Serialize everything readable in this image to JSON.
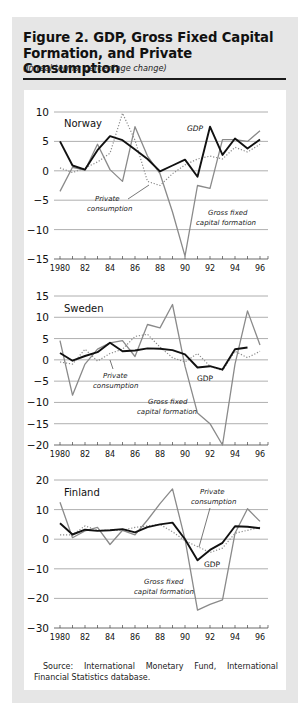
{
  "figure": {
    "title": "Figure 2.  GDP, Gross Fixed Capital Formation, and Private Consumption",
    "title_line1": "Figure 2.  GDP, Gross Fixed Capital",
    "title_line2": "Formation, and Private Consumption",
    "subtitle": "(In real terms; percentage change)",
    "source": "Source: International Monetary Fund, International Financial Statistics database."
  },
  "colors": {
    "frame": "#e6e6e6",
    "gdp": "#111111",
    "gfcf": "#8a8a8a",
    "private_consumption": "#8a8a8a",
    "grid": "#9a9a9a"
  },
  "chart_data": [
    {
      "type": "line",
      "panel": "Norway",
      "title": "Norway",
      "xlabel": "",
      "ylabel": "percentage change",
      "x": [
        1980,
        1981,
        1982,
        1983,
        1984,
        1985,
        1986,
        1987,
        1988,
        1989,
        1990,
        1991,
        1992,
        1993,
        1994,
        1995,
        1996
      ],
      "x_tick_labels": [
        "1980",
        "82",
        "84",
        "86",
        "88",
        "90",
        "92",
        "94",
        "96"
      ],
      "ylim": [
        -15,
        10
      ],
      "y_ticks": [
        10,
        5,
        0,
        -5,
        -10,
        -15
      ],
      "y_tick_labels": [
        "10",
        "5",
        "0",
        "−5",
        "−10",
        "−15"
      ],
      "grid": true,
      "series": [
        {
          "name": "GDP",
          "style": "solid-thick-black",
          "values": [
            5.0,
            0.9,
            0.2,
            3.5,
            5.9,
            5.2,
            3.6,
            2.0,
            -0.1,
            0.9,
            1.9,
            -1.0,
            7.5,
            2.7,
            5.5,
            3.8,
            5.3
          ]
        },
        {
          "name": "Private consumption",
          "style": "dotted-gray",
          "values": [
            0.5,
            -0.3,
            0.5,
            1.5,
            3.0,
            9.8,
            5.2,
            -1.8,
            -2.5,
            -0.5,
            1.0,
            2.0,
            2.5,
            2.0,
            4.0,
            3.2,
            4.5
          ]
        },
        {
          "name": "Gross fixed capital formation",
          "style": "solid-gray",
          "values": [
            -3.5,
            0.6,
            0.1,
            4.5,
            0.2,
            -1.8,
            7.5,
            2.5,
            -0.5,
            -7.0,
            -14.5,
            -2.5,
            -3.0,
            5.3,
            5.3,
            5.0,
            6.8
          ]
        }
      ],
      "annotations": [
        "GDP",
        "Private consumption",
        "Gross fixed capital formation"
      ]
    },
    {
      "type": "line",
      "panel": "Sweden",
      "title": "Sweden",
      "xlabel": "",
      "ylabel": "percentage change",
      "x": [
        1980,
        1981,
        1982,
        1983,
        1984,
        1985,
        1986,
        1987,
        1988,
        1989,
        1990,
        1991,
        1992,
        1993,
        1994,
        1995,
        1996
      ],
      "x_tick_labels": [
        "1980",
        "82",
        "84",
        "86",
        "88",
        "90",
        "92",
        "94",
        "96"
      ],
      "ylim": [
        -20,
        15
      ],
      "y_ticks": [
        15,
        10,
        5,
        0,
        -5,
        -10,
        -15,
        -20
      ],
      "y_tick_labels": [
        "15",
        "10",
        "5",
        "0",
        "−5",
        "−10",
        "−15",
        "−20"
      ],
      "grid": true,
      "series": [
        {
          "name": "GDP",
          "style": "solid-thick-black",
          "values": [
            1.6,
            -0.2,
            0.9,
            1.8,
            4.0,
            2.0,
            2.2,
            2.7,
            2.6,
            2.3,
            1.3,
            -1.8,
            -1.5,
            -2.3,
            2.5,
            2.9,
            null
          ]
        },
        {
          "name": "Private consumption",
          "style": "dotted-gray",
          "values": [
            -0.5,
            -1.0,
            2.5,
            -0.3,
            1.5,
            2.5,
            5.5,
            6.0,
            3.0,
            0.5,
            -0.5,
            1.5,
            -1.5,
            -2.5,
            2.0,
            0.5,
            2.0
          ]
        },
        {
          "name": "Gross fixed capital formation",
          "style": "solid-gray",
          "values": [
            4.5,
            -8.3,
            -1.0,
            2.5,
            4.0,
            4.5,
            0.8,
            8.3,
            7.5,
            13.0,
            -1.5,
            -12.5,
            -15.0,
            -20.0,
            -1.0,
            11.5,
            3.5
          ]
        }
      ],
      "annotations": [
        "GDP",
        "Private consumption",
        "Gross fixed capital formation"
      ]
    },
    {
      "type": "line",
      "panel": "Finland",
      "title": "Finland",
      "xlabel": "",
      "ylabel": "percentage change",
      "x": [
        1980,
        1981,
        1982,
        1983,
        1984,
        1985,
        1986,
        1987,
        1988,
        1989,
        1990,
        1991,
        1992,
        1993,
        1994,
        1995,
        1996
      ],
      "x_tick_labels": [
        "1980",
        "82",
        "84",
        "86",
        "88",
        "90",
        "92",
        "94",
        "96"
      ],
      "ylim": [
        -30,
        20
      ],
      "y_ticks": [
        20,
        10,
        0,
        -10,
        -20,
        -30
      ],
      "y_tick_labels": [
        "20",
        "10",
        "0",
        "−10",
        "−20",
        "−30"
      ],
      "grid": true,
      "series": [
        {
          "name": "GDP",
          "style": "solid-thick-black",
          "values": [
            5.4,
            1.6,
            3.2,
            2.8,
            3.0,
            3.4,
            2.3,
            4.1,
            5.0,
            5.6,
            0.0,
            -7.1,
            -3.6,
            -1.2,
            4.4,
            4.2,
            3.7
          ]
        },
        {
          "name": "Private consumption",
          "style": "dotted-gray",
          "values": [
            1.5,
            1.5,
            4.5,
            3.0,
            3.0,
            3.0,
            4.0,
            4.5,
            5.0,
            2.5,
            -0.5,
            -2.5,
            -4.5,
            -3.0,
            2.0,
            3.0,
            4.0
          ]
        },
        {
          "name": "Gross fixed capital formation",
          "style": "solid-gray",
          "values": [
            12.5,
            0.5,
            2.8,
            4.0,
            -1.8,
            3.0,
            1.5,
            6.5,
            12.0,
            17.0,
            0.0,
            -24.0,
            -22.0,
            -20.5,
            2.0,
            10.3,
            6.0
          ]
        }
      ],
      "annotations": [
        "Private consumption",
        "GDP",
        "Gross fixed capital formation"
      ]
    }
  ],
  "labels": {
    "norway": {
      "name": "Norway",
      "gdp": "GDP",
      "pc1": "Private",
      "pc2": "consumption",
      "gf1": "Gross fixed",
      "gf2": "capital formation"
    },
    "sweden": {
      "name": "Sweden",
      "gdp": "GDP",
      "pc1": "Private",
      "pc2": "consumption",
      "gf1": "Gross fixed",
      "gf2": "capital formation"
    },
    "finland": {
      "name": "Finland",
      "gdp": "GDP",
      "pc1": "Private",
      "pc2": "consumption",
      "gf1": "Gross fixed",
      "gf2": "capital formation"
    }
  }
}
